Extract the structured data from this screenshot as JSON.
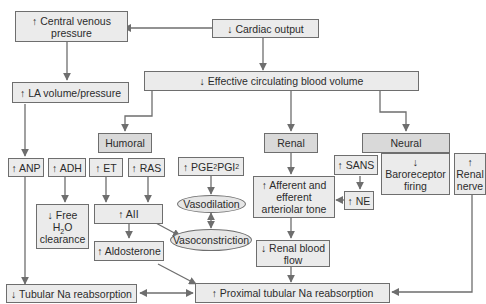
{
  "colors": {
    "box_fill": "#ebebeb",
    "header_fill": "#d9d9d9",
    "line": "#6e6e6e",
    "text": "#2b2b2b"
  },
  "nodes": {
    "cvp": "↑ Central venous\npressure",
    "cardiac_output": "↓ Cardiac output",
    "la_volume": "↑ LA volume/pressure",
    "ecbv": "↓ Effective circulating blood volume",
    "humoral": "Humoral",
    "renal": "Renal",
    "neural": "Neural",
    "anp": "↑ ANP",
    "adh": "↑ ADH",
    "et": "↑ ET",
    "ras": "↑ RAS",
    "pge_pre": "↑ PGE",
    "pge_sub": "2",
    "pgi_pre": " PGI",
    "pgi_sub": "2",
    "sans": "↑ SANS",
    "baroreceptor": "↓\nBaroreceptor\nfiring",
    "renal_nerve": "↑\nRenal\nnerve",
    "free_water_pre": "↓ Free\nH",
    "free_water_sub": "2",
    "free_water_post": "O\nclearance",
    "aii": "↑ AII",
    "vasodilation": "Vasodilation",
    "aff_eff_tone": "↑ Afferent and\nefferent\narteriolar tone",
    "ne": "↑ NE",
    "vasoconstriction": "Vasoconstriction",
    "aldosterone": "↑ Aldosterone",
    "renal_blood_flow": "↓ Renal blood\nflow",
    "tubular_na": "↓ Tubular Na reabsorption",
    "proximal_na": "↑ Proximal tubular Na reabsorption"
  }
}
